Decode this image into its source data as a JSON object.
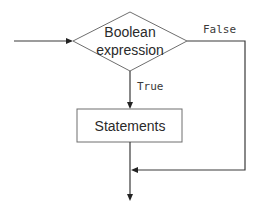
{
  "diagram": {
    "type": "flowchart",
    "nodes": {
      "decision": {
        "shape": "diamond",
        "lines": [
          "Boolean",
          "expression"
        ]
      },
      "process": {
        "shape": "rectangle",
        "label": "Statements"
      }
    },
    "edges": {
      "entry": {
        "from": "start",
        "to": "decision",
        "label": ""
      },
      "true_branch": {
        "from": "decision",
        "to": "process",
        "label": "True"
      },
      "false_branch": {
        "from": "decision",
        "to": "merge",
        "label": "False"
      },
      "process_out": {
        "from": "process",
        "to": "merge",
        "label": ""
      },
      "exit": {
        "from": "merge",
        "to": "end",
        "label": ""
      }
    },
    "colors": {
      "line": "#3a3a3a",
      "shape_border": "#6e6e6e",
      "text": "#2a2a2a"
    }
  }
}
